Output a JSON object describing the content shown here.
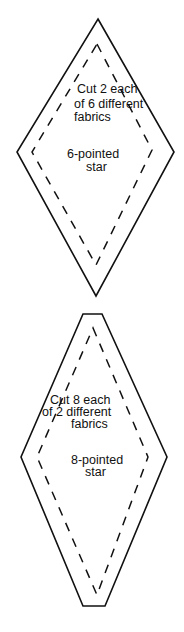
{
  "template_6": {
    "cut_lines": [
      "Cut 2 each",
      "of 6 different",
      "fabrics"
    ],
    "name_lines": [
      "6-pointed",
      "star"
    ]
  },
  "template_8": {
    "cut_lines": [
      "Cut 8 each",
      "of 2 different",
      "fabrics"
    ],
    "name_lines": [
      "8-pointed",
      "star"
    ]
  },
  "colors": {
    "line": "#111111",
    "background": "#ffffff"
  }
}
